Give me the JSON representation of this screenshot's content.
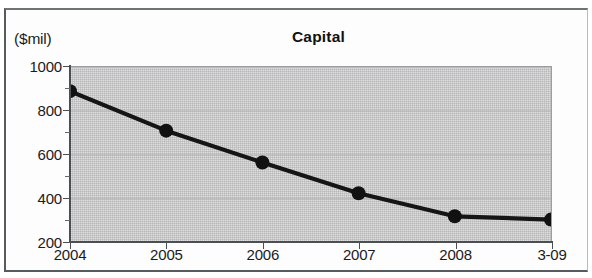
{
  "figure": {
    "unit_label": "($mil)",
    "title": "Capital"
  },
  "chart_data": {
    "type": "line",
    "title": "Capital",
    "subtitle": "",
    "xlabel": "",
    "ylabel": "($mil)",
    "unit": "$mil",
    "categories": [
      "2004",
      "2005",
      "2006",
      "2007",
      "2008",
      "3-09"
    ],
    "values": [
      890,
      710,
      565,
      425,
      320,
      305
    ],
    "series": [
      {
        "name": "Capital",
        "values": [
          890,
          710,
          565,
          425,
          320,
          305
        ]
      }
    ],
    "ylim": [
      200,
      1000
    ],
    "y_ticks": [
      200,
      400,
      600,
      800,
      1000
    ],
    "y_tick_labels": [
      "200",
      "400",
      "600",
      "800",
      "1000"
    ],
    "y_minor_ticks": [
      300,
      500,
      700,
      900
    ],
    "grid": true,
    "grid_axis": "y",
    "legend": false,
    "legend_position": "none",
    "marker": "filled-circle",
    "line_color": "#151515",
    "marker_color": "#111111",
    "plot_background": "#dedede",
    "annotations": []
  },
  "colors": {
    "ink": "#1b1b1b",
    "axis": "#4a4f52",
    "plot_bg": "#dedede",
    "grid": "#b4b7b9",
    "frame": "#555b5e"
  }
}
